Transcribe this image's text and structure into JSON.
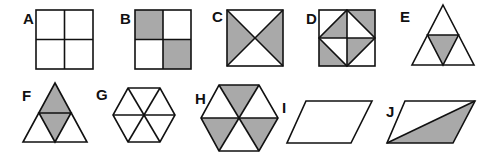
{
  "figure": {
    "shading_color": "#a9a9a9",
    "line_color": "#111111",
    "shapes": [
      {
        "label": "A",
        "type": "square",
        "divisions": "4 equal squares",
        "shaded": "none"
      },
      {
        "label": "B",
        "type": "square",
        "divisions": "4 equal squares",
        "shaded": "top-left and bottom-right squares"
      },
      {
        "label": "C",
        "type": "square",
        "divisions": "4 triangles by diagonals",
        "shaded": "left and right triangles"
      },
      {
        "label": "D",
        "type": "square",
        "divisions": "4 squares each split diagonally (inscribed diamond)",
        "shaded": "4 of 8 triangles"
      },
      {
        "label": "E",
        "type": "triangle",
        "divisions": "4 equal triangles",
        "shaded": "center triangle"
      },
      {
        "label": "F",
        "type": "triangle",
        "divisions": "4 equal triangles",
        "shaded": "top and center triangles"
      },
      {
        "label": "G",
        "type": "hexagon",
        "divisions": "6 equal triangles",
        "shaded": "none"
      },
      {
        "label": "H",
        "type": "hexagon",
        "divisions": "6 equal triangles",
        "shaded": "top, bottom-left, bottom-right triangles"
      },
      {
        "label": "I",
        "type": "parallelogram",
        "divisions": "none",
        "shaded": "none"
      },
      {
        "label": "J",
        "type": "parallelogram",
        "divisions": "split by diagonal",
        "shaded": "lower triangle"
      }
    ]
  }
}
